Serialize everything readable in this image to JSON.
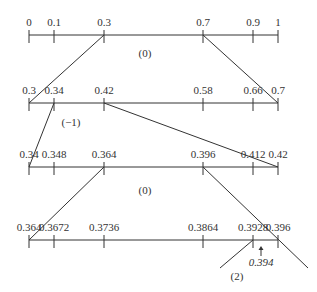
{
  "diagram": {
    "type": "interval-subdivision",
    "colors": {
      "ink": "#333333",
      "background": "#ffffff"
    },
    "axes": [
      {
        "id": "level-1",
        "y": 35,
        "ticks": [
          {
            "label": "0",
            "x": 29
          },
          {
            "label": "0.1",
            "x": 54
          },
          {
            "label": "0.3",
            "x": 104
          },
          {
            "label": "0.7",
            "x": 203
          },
          {
            "label": "0.9",
            "x": 253
          },
          {
            "label": "1",
            "x": 278
          }
        ],
        "annotation": {
          "label": "(0)",
          "x": 145,
          "y": 57
        }
      },
      {
        "id": "level-2",
        "y": 103,
        "ticks": [
          {
            "label": "0.3",
            "x": 29
          },
          {
            "label": "0.34",
            "x": 54
          },
          {
            "label": "0.42",
            "x": 104
          },
          {
            "label": "0.58",
            "x": 203
          },
          {
            "label": "0.66",
            "x": 253
          },
          {
            "label": "0.7",
            "x": 278
          }
        ],
        "annotation": {
          "label": "(−1)",
          "x": 71,
          "y": 126
        }
      },
      {
        "id": "level-3",
        "y": 167,
        "ticks": [
          {
            "label": "0.34",
            "x": 29
          },
          {
            "label": "0.348",
            "x": 54
          },
          {
            "label": "0.364",
            "x": 104
          },
          {
            "label": "0.396",
            "x": 203
          },
          {
            "label": "0.412",
            "x": 253
          },
          {
            "label": "0.42",
            "x": 278
          }
        ],
        "annotation": {
          "label": "(0)",
          "x": 145,
          "y": 194
        }
      },
      {
        "id": "level-4",
        "y": 240,
        "ticks": [
          {
            "label": "0.364",
            "x": 29
          },
          {
            "label": "0.3672",
            "x": 54
          },
          {
            "label": "0.3736",
            "x": 104
          },
          {
            "label": "0.3864",
            "x": 203
          },
          {
            "label": "0.3928",
            "x": 253
          },
          {
            "label": "0.396",
            "x": 278
          }
        ],
        "annotation": {
          "label": "(2)",
          "x": 237,
          "y": 280
        }
      }
    ],
    "connectors": [
      {
        "from": [
          104,
          35
        ],
        "to": [
          29,
          103
        ]
      },
      {
        "from": [
          203,
          35
        ],
        "to": [
          278,
          103
        ]
      },
      {
        "from": [
          54,
          103
        ],
        "to": [
          29,
          167
        ]
      },
      {
        "from": [
          104,
          103
        ],
        "to": [
          278,
          167
        ]
      },
      {
        "from": [
          104,
          167
        ],
        "to": [
          29,
          240
        ]
      },
      {
        "from": [
          203,
          167
        ],
        "to": [
          308,
          268
        ]
      },
      {
        "from": [
          253,
          240
        ],
        "to": [
          220,
          268
        ]
      }
    ],
    "marker": {
      "label": "0.394",
      "x": 261,
      "arrow_top": 246,
      "arrow_bottom": 256,
      "label_y": 266
    }
  }
}
